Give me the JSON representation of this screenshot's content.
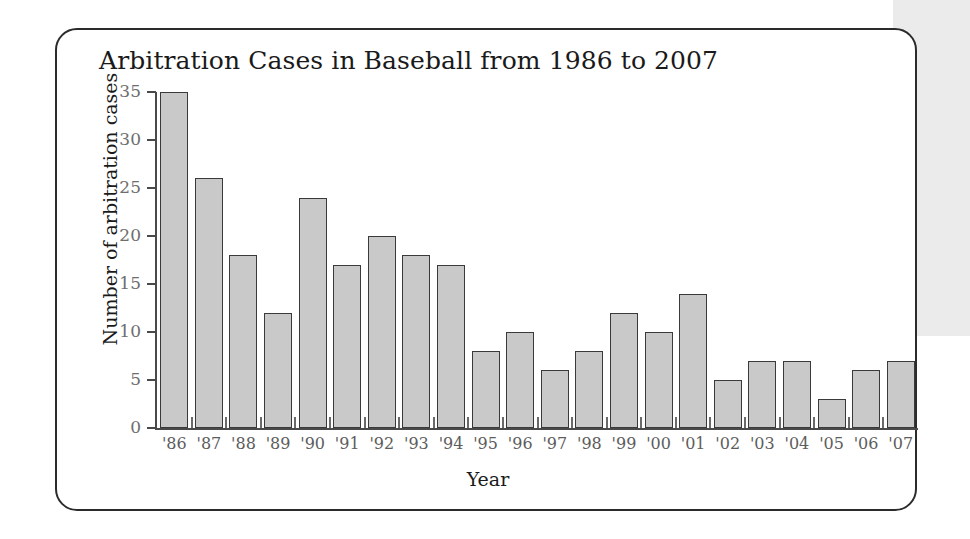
{
  "figure": {
    "title": "Arbitration Cases in Baseball from 1986 to 2007",
    "card_border_color": "#2b2b2b",
    "background_color": "#ffffff",
    "side_panel_color": "#ebebeb"
  },
  "chart_data": {
    "type": "bar",
    "title": "Arbitration Cases in Baseball from 1986 to 2007",
    "xlabel": "Year",
    "ylabel": "Number of arbitration cases",
    "categories": [
      "'86",
      "'87",
      "'88",
      "'89",
      "'90",
      "'91",
      "'92",
      "'93",
      "'94",
      "'95",
      "'96",
      "'97",
      "'98",
      "'99",
      "'00",
      "'01",
      "'02",
      "'03",
      "'04",
      "'05",
      "'06",
      "'07"
    ],
    "values": [
      35,
      26,
      18,
      12,
      24,
      17,
      20,
      18,
      17,
      8,
      10,
      6,
      8,
      12,
      10,
      14,
      5,
      7,
      7,
      3,
      6,
      7
    ],
    "ylim": [
      0,
      35
    ],
    "yticks": [
      0,
      5,
      10,
      15,
      20,
      25,
      30,
      35
    ],
    "ytick_labels": [
      "0",
      "5",
      "10",
      "15",
      "20",
      "25",
      "30",
      "35"
    ],
    "grid": false,
    "legend": false,
    "bar_fill_color": "#c9c9c9",
    "bar_edge_color": "#3a3a3a"
  }
}
